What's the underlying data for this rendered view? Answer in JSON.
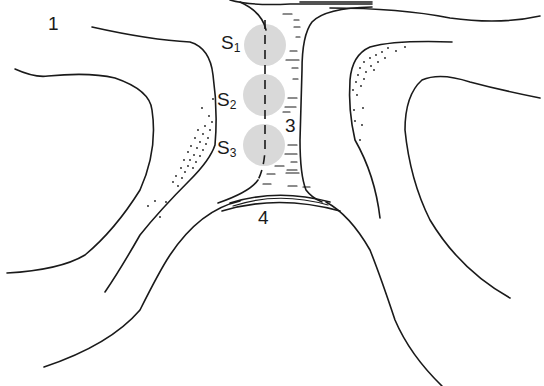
{
  "diagram": {
    "type": "anatomical-line-drawing",
    "labels": {
      "region_1": "1",
      "region_3": "3",
      "region_4": "4",
      "s1": {
        "main": "S",
        "sub": "1"
      },
      "s2": {
        "main": "S",
        "sub": "2"
      },
      "s3": {
        "main": "S",
        "sub": "3"
      }
    },
    "colors": {
      "stroke": "#1a1a1a",
      "circle_fill": "#d9d9d9",
      "background": "#ffffff"
    },
    "circles": [
      {
        "id": "S1",
        "cx": 265,
        "cy": 45,
        "r": 21
      },
      {
        "id": "S2",
        "cx": 264,
        "cy": 95,
        "r": 21
      },
      {
        "id": "S3",
        "cx": 264,
        "cy": 145,
        "r": 21
      }
    ]
  }
}
